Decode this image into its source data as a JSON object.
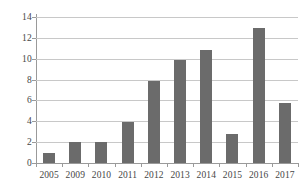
{
  "chart_data": {
    "type": "bar",
    "title": "",
    "subtitle": "",
    "xlabel": "",
    "ylabel": "",
    "categories": [
      "2005",
      "2009",
      "2010",
      "2011",
      "2012",
      "2013",
      "2014",
      "2015",
      "2016",
      "2017"
    ],
    "values": [
      1,
      2,
      2,
      3.9,
      7.9,
      9.9,
      10.8,
      2.8,
      12.9,
      5.8
    ],
    "series": [
      {
        "name": "",
        "values": [
          1,
          2,
          2,
          3.9,
          7.9,
          9.9,
          10.8,
          2.8,
          12.9,
          5.8
        ]
      }
    ],
    "ylim": [
      0,
      14
    ],
    "ytick_labels": [
      "0",
      "2",
      "4",
      "6",
      "8",
      "10",
      "12",
      "14"
    ],
    "ytick_values": [
      0,
      2,
      4,
      6,
      8,
      10,
      12,
      14
    ],
    "xtick_labels": [
      "2005",
      "2009",
      "2010",
      "2011",
      "2012",
      "2013",
      "2014",
      "2015",
      "2016",
      "2017"
    ],
    "grid": true,
    "grid_axis": "y",
    "legend": false,
    "legend_position": "none",
    "annotations": [],
    "bar_color": "#6b6b6b",
    "grid_color": "#c8c8c8",
    "axis_color": "#9a9a9a",
    "background_color": "#ffffff",
    "text_color": "#464646"
  }
}
